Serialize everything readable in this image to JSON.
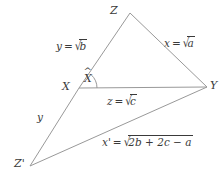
{
  "figure": {
    "type": "geometry-diagram",
    "background_color": "#ffffff",
    "line_color": "#999999",
    "text_color": "#3a3a3a",
    "vertices": {
      "Z": {
        "label": "Z",
        "x": 130,
        "y": 13
      },
      "X": {
        "label": "X",
        "x": 79,
        "y": 88
      },
      "Y": {
        "label": "Y",
        "x": 207,
        "y": 87
      },
      "Zprime": {
        "label": "Z'",
        "x": 30,
        "y": 166
      }
    },
    "angle": {
      "at": "X",
      "label": "X",
      "accent": "^",
      "arc_radius": 18
    },
    "edges": [
      {
        "name": "XZ",
        "label_var": "y",
        "label_eq": "=",
        "label_value": "b",
        "radical": true,
        "text": "y = √b"
      },
      {
        "name": "ZY",
        "label_var": "x",
        "label_eq": "=",
        "label_value": "a",
        "radical": true,
        "text": "x = √a"
      },
      {
        "name": "XY",
        "label_var": "z",
        "label_eq": "=",
        "label_value": "c",
        "radical": true,
        "text": "z = √c"
      },
      {
        "name": "XZprime",
        "label_var": "y",
        "label_eq": "",
        "label_value": "",
        "radical": false,
        "text": "y"
      },
      {
        "name": "ZprimeY",
        "label_var": "x'",
        "label_eq": "=",
        "label_value": "2b + 2c − a",
        "radical": true,
        "text": "x' = √(2b + 2c − a)"
      }
    ]
  }
}
